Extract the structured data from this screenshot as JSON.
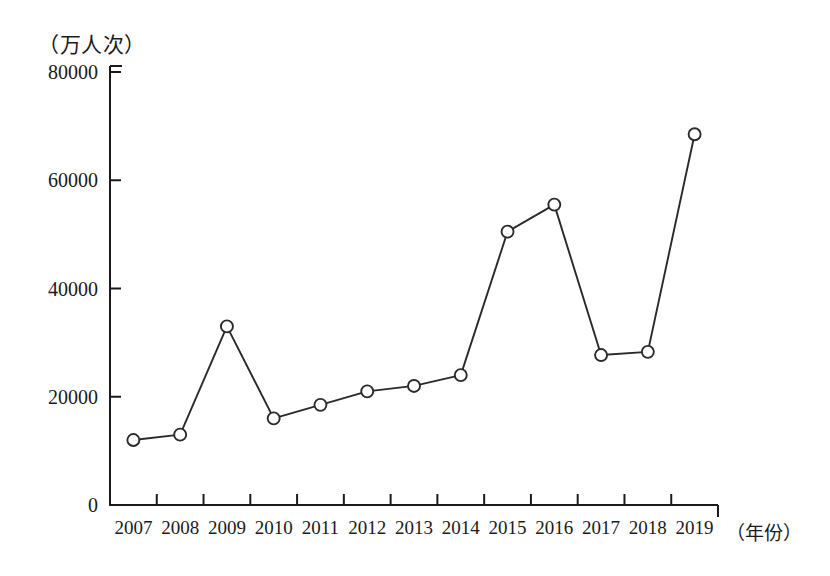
{
  "chart_data": {
    "type": "line",
    "title": "",
    "unit_label": "（万人次）",
    "xlabel": "（年份）",
    "ylabel": "",
    "categories": [
      "2007",
      "2008",
      "2009",
      "2010",
      "2011",
      "2012",
      "2013",
      "2014",
      "2015",
      "2016",
      "2017",
      "2018",
      "2019"
    ],
    "values": [
      12000,
      13000,
      33000,
      16000,
      18500,
      21000,
      22000,
      24000,
      50500,
      55500,
      27700,
      28300,
      68500
    ],
    "ylim": [
      0,
      80000
    ],
    "yticks": [
      0,
      20000,
      40000,
      60000,
      80000
    ],
    "ytick_labels": [
      "0",
      "20000",
      "40000",
      "60000",
      "80000"
    ],
    "grid": false,
    "legend": false,
    "marker": "open-circle",
    "line_color": "#2a2a2a",
    "marker_fill": "#ffffff",
    "background": "#ffffff"
  }
}
